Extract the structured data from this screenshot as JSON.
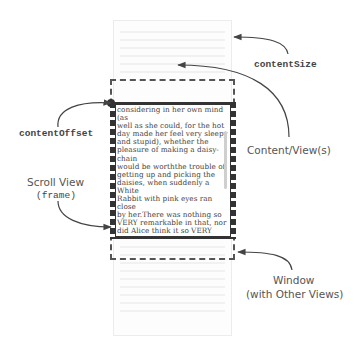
{
  "labels": {
    "content_size": "contentSize",
    "content_views": "Content/View(s)",
    "content_offset": "contentOffset",
    "scroll_view": "Scroll View",
    "scroll_view_sub": "(frame)",
    "window": "Window",
    "window_sub": "(with Other Views)"
  },
  "scroll_view": {
    "text": "considering in her own mind (as\nwell as she could, for the hot\nday made her feel very sleepy\nand stupid), whether the\npleasure of making a daisy-chain\nwould be worththe trouble of\ngetting up and picking the\ndaisies, when suddenly a White\nRabbit with pink eyes ran close\nby her.There was nothing so\nVERY remarkable in that, nor\ndid Alice think it so VERY much\nout of the way to hear the\nRabbit say to itself, 'Oh dear! Oh\ndear! I shall be late!' (when she\nthought it over afterwards, it\noccurred to her that she ought"
  },
  "colors": {
    "frame": "#333333",
    "dashed": "#555555",
    "content_bg": "#fdfdfd",
    "label": "#555555"
  }
}
